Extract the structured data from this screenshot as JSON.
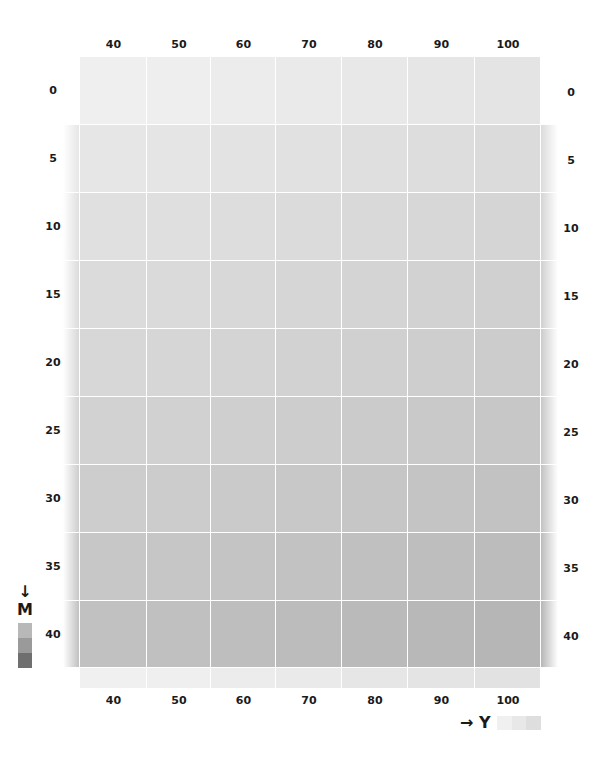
{
  "chart_data": {
    "type": "heatmap",
    "title": "",
    "xlabel": "Y",
    "ylabel": "M",
    "x_axis_direction": "right",
    "y_axis_direction": "down",
    "x_ticks": [
      "40",
      "50",
      "60",
      "70",
      "80",
      "90",
      "100"
    ],
    "y_ticks": [
      "0",
      "5",
      "10",
      "15",
      "20",
      "25",
      "30",
      "35",
      "40"
    ],
    "grid": true,
    "colors": [
      [
        "#efefef",
        "#eeeeee",
        "#ececec",
        "#eaeaea",
        "#e8e8e8",
        "#e6e6e6",
        "#e4e4e4"
      ],
      [
        "#e6e6e6",
        "#e5e5e5",
        "#e3e3e3",
        "#e1e1e1",
        "#dfdfdf",
        "#dddddd",
        "#dbdbdb"
      ],
      [
        "#e0e0e0",
        "#dfdfdf",
        "#dddddd",
        "#dbdbdb",
        "#d9d9d9",
        "#d7d7d7",
        "#d5d5d5"
      ],
      [
        "#dbdbdb",
        "#dadada",
        "#d8d8d8",
        "#d6d6d6",
        "#d4d4d4",
        "#d2d2d2",
        "#d0d0d0"
      ],
      [
        "#d7d7d7",
        "#d6d6d6",
        "#d4d4d4",
        "#d2d2d2",
        "#d0d0d0",
        "#cecece",
        "#cccccc"
      ],
      [
        "#d2d2d2",
        "#d1d1d1",
        "#cfcfcf",
        "#cdcdcd",
        "#cbcbcb",
        "#c9c9c9",
        "#c7c7c7"
      ],
      [
        "#cdcdcd",
        "#cccccc",
        "#cacaca",
        "#c8c8c8",
        "#c6c6c6",
        "#c4c4c4",
        "#c2c2c2"
      ],
      [
        "#c7c7c7",
        "#c6c6c6",
        "#c4c4c4",
        "#c2c2c2",
        "#c0c0c0",
        "#bebebe",
        "#bcbcbc"
      ],
      [
        "#c1c1c1",
        "#c0c0c0",
        "#bebebe",
        "#bcbcbc",
        "#bababa",
        "#b8b8b8",
        "#b6b6b6"
      ]
    ],
    "bottom_strip_colors": [
      "#f0f0f0",
      "#efefef",
      "#ececec",
      "#eaeaea",
      "#e6e6e6",
      "#e4e4e4",
      "#e2e2e2"
    ],
    "legend": {
      "M": {
        "label": "M",
        "arrow": "down",
        "swatches": [
          "#b8b8b8",
          "#9a9a9a",
          "#6f6f6f"
        ]
      },
      "Y": {
        "label": "Y",
        "arrow": "right",
        "swatches": [
          "#f0f0f0",
          "#e8e8e8",
          "#dedede"
        ]
      }
    }
  },
  "axes": {
    "top_labels": [
      "40",
      "50",
      "60",
      "70",
      "80",
      "90",
      "100"
    ],
    "bottom_labels": [
      "40",
      "50",
      "60",
      "70",
      "80",
      "90",
      "100"
    ],
    "left_labels": [
      "0",
      "5",
      "10",
      "15",
      "20",
      "25",
      "30",
      "35",
      "40"
    ],
    "right_labels": [
      "0",
      "5",
      "10",
      "15",
      "20",
      "25",
      "30",
      "35",
      "40"
    ]
  },
  "legend": {
    "m_arrow": "↓",
    "m_label": "M",
    "y_arrow": "→",
    "y_label": "Y"
  }
}
